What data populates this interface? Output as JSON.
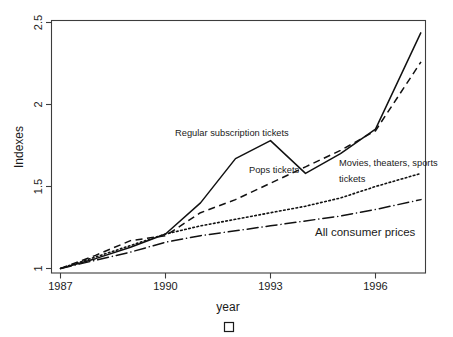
{
  "figure": {
    "width": 453,
    "height": 337,
    "background": "#ffffff",
    "ink_color": "#111111",
    "frame_color": "#3d3d3d"
  },
  "marker": {
    "name": "empty-square-marker",
    "glyph": ""
  },
  "chart_data": {
    "type": "line",
    "title": "",
    "subtitle": "",
    "xlabel": "year",
    "ylabel": "Indexes",
    "xlim": [
      1987,
      1997.3
    ],
    "ylim": [
      1,
      2.5
    ],
    "grid": false,
    "legend_position": "inline-annotations",
    "x_ticks": [
      1987,
      1990,
      1993,
      1996
    ],
    "x_tick_labels": [
      "1987",
      "1990",
      "1993",
      "1996"
    ],
    "y_ticks": [
      1,
      1.5,
      2,
      2.5
    ],
    "y_tick_labels": [
      "1",
      "1.5",
      "2",
      "2.5"
    ],
    "x": [
      1987,
      1988,
      1989,
      1990,
      1991,
      1992,
      1993,
      1994,
      1995,
      1996,
      1997.3
    ],
    "series": [
      {
        "name": "Regular subscription tickets",
        "style": "solid",
        "label_x": 1991.1,
        "label_y": 1.93,
        "values": [
          1.0,
          1.06,
          1.13,
          1.21,
          1.4,
          1.67,
          1.78,
          1.58,
          1.7,
          1.85,
          2.44
        ]
      },
      {
        "name": "Pops tickets",
        "style": "dashed",
        "label_x": 1992.4,
        "label_y": 1.62,
        "values": [
          1.0,
          1.08,
          1.17,
          1.2,
          1.34,
          1.42,
          1.52,
          1.62,
          1.72,
          1.84,
          2.26
        ]
      },
      {
        "name": "Movies, theaters, sports tickets",
        "style": "dotted",
        "label_x": 1994.1,
        "label_y": 1.62,
        "label_line2": "tickets",
        "values": [
          1.0,
          1.07,
          1.14,
          1.21,
          1.26,
          1.3,
          1.34,
          1.38,
          1.43,
          1.5,
          1.58
        ]
      },
      {
        "name": "All consumer prices",
        "style": "dashdot",
        "label_x": 1994.2,
        "label_y": 1.28,
        "values": [
          1.0,
          1.05,
          1.1,
          1.16,
          1.2,
          1.23,
          1.26,
          1.29,
          1.32,
          1.36,
          1.42
        ]
      }
    ],
    "annotations": [
      {
        "text": "Regular subscription tickets",
        "series": "Regular subscription tickets"
      },
      {
        "text": "Pops tickets",
        "series": "Pops tickets"
      },
      {
        "text": "Movies, theaters, sports",
        "series": "Movies, theaters, sports tickets"
      },
      {
        "text": "tickets",
        "series": "Movies, theaters, sports tickets"
      },
      {
        "text": "All consumer prices",
        "series": "All consumer prices"
      }
    ]
  }
}
